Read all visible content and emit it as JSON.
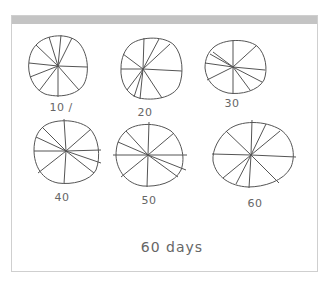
{
  "sketch": {
    "caption": "60 days",
    "stroke_color": "#555555",
    "header_color": "#c4c4c4",
    "border_color": "#cfcfcf",
    "circles": [
      {
        "label": "10 /",
        "cx": 58,
        "cy": 66,
        "rx": 29,
        "ry": 29,
        "spokes": 10
      },
      {
        "label": "20",
        "cx": 152,
        "cy": 69,
        "rx": 31,
        "ry": 29,
        "spokes": 10
      },
      {
        "label": "30",
        "cx": 233,
        "cy": 67,
        "rx": 30,
        "ry": 27,
        "spokes": 10
      },
      {
        "label": "40",
        "cx": 66,
        "cy": 151,
        "rx": 31,
        "ry": 31,
        "spokes": 10
      },
      {
        "label": "50",
        "cx": 148,
        "cy": 155,
        "rx": 32,
        "ry": 31,
        "spokes": 10
      },
      {
        "label": "60",
        "cx": 252,
        "cy": 156,
        "rx": 40,
        "ry": 32,
        "spokes": 10
      }
    ]
  }
}
